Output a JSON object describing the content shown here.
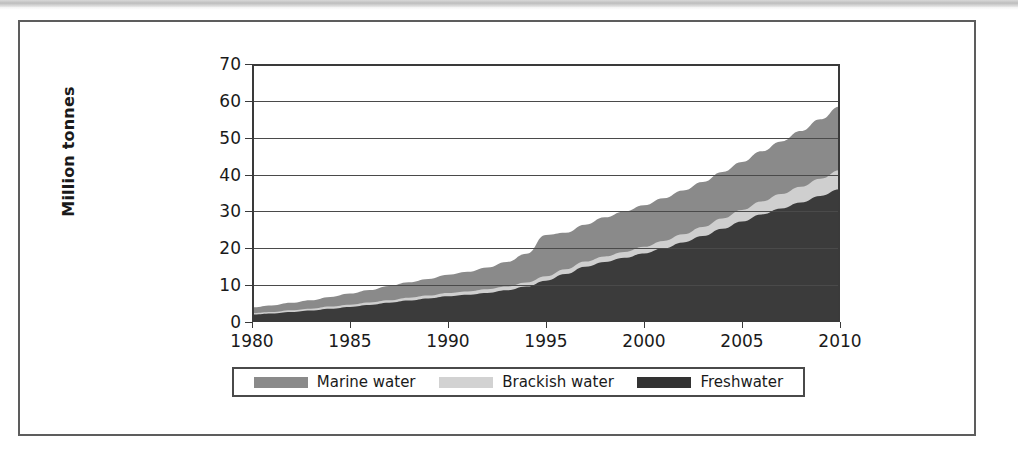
{
  "figure": {
    "type": "stacked-area-chart",
    "background_color": "#ffffff",
    "frame_color": "#5d5d5d"
  },
  "chart_data": {
    "type": "area",
    "stacked": true,
    "title": "",
    "xlabel": "",
    "ylabel": "Million tonnes",
    "xlim": [
      1980,
      2010
    ],
    "ylim": [
      0,
      70
    ],
    "grid": true,
    "legend_position": "bottom",
    "x": [
      1980,
      1981,
      1982,
      1983,
      1984,
      1985,
      1986,
      1987,
      1988,
      1989,
      1990,
      1991,
      1992,
      1993,
      1994,
      1995,
      1996,
      1997,
      1998,
      1999,
      2000,
      2001,
      2002,
      2003,
      2004,
      2005,
      2006,
      2007,
      2008,
      2009,
      2010
    ],
    "xticks": [
      1980,
      1985,
      1990,
      1995,
      2000,
      2005,
      2010
    ],
    "yticks": [
      0,
      10,
      20,
      30,
      40,
      50,
      60,
      70
    ],
    "series": [
      {
        "name": "Freshwater",
        "color": "#3b3b3b",
        "values": [
          2.0,
          2.3,
          2.7,
          3.1,
          3.6,
          4.1,
          4.6,
          5.2,
          5.8,
          6.4,
          7.0,
          7.4,
          7.9,
          8.6,
          9.6,
          11.2,
          13.0,
          15.0,
          16.3,
          17.4,
          18.6,
          20.0,
          21.6,
          23.3,
          25.3,
          27.3,
          29.2,
          30.8,
          32.4,
          34.2,
          36.0
        ]
      },
      {
        "name": "Brackish water",
        "color": "#cfcfcf",
        "values": [
          0.4,
          0.4,
          0.5,
          0.5,
          0.6,
          0.6,
          0.7,
          0.7,
          0.8,
          0.8,
          0.9,
          0.9,
          1.0,
          1.0,
          1.1,
          1.2,
          1.3,
          1.4,
          1.5,
          1.6,
          1.8,
          2.0,
          2.2,
          2.5,
          2.8,
          3.1,
          3.5,
          3.9,
          4.3,
          4.7,
          5.2
        ]
      },
      {
        "name": "Marine water",
        "color": "#8a8a8a",
        "values": [
          1.6,
          1.8,
          2.0,
          2.3,
          2.6,
          3.0,
          3.4,
          3.9,
          4.2,
          4.5,
          4.9,
          5.3,
          5.9,
          6.7,
          7.8,
          11.2,
          9.9,
          10.0,
          10.6,
          11.0,
          11.3,
          11.6,
          11.9,
          12.2,
          12.6,
          13.0,
          13.6,
          14.3,
          15.1,
          16.1,
          17.3
        ]
      }
    ],
    "series_totals": [
      4.0,
      4.5,
      5.2,
      5.9,
      6.8,
      7.7,
      8.7,
      9.8,
      10.8,
      11.7,
      12.8,
      13.6,
      14.8,
      16.3,
      18.5,
      23.6,
      24.2,
      26.4,
      28.4,
      30.0,
      31.7,
      33.6,
      35.7,
      38.0,
      40.7,
      43.4,
      46.3,
      49.0,
      51.8,
      55.0,
      58.5
    ]
  },
  "axes": {
    "y_title": "Million tonnes",
    "y_tick_labels": [
      "70",
      "60",
      "50",
      "40",
      "30",
      "20",
      "10",
      "0"
    ],
    "x_tick_labels": [
      "1980",
      "1985",
      "1990",
      "1995",
      "2000",
      "2005",
      "2010"
    ]
  },
  "legend": {
    "items": [
      {
        "label": "Marine water",
        "color": "#8a8a8a"
      },
      {
        "label": "Brackish water",
        "color": "#d2d2d2"
      },
      {
        "label": "Freshwater",
        "color": "#333333"
      }
    ]
  }
}
